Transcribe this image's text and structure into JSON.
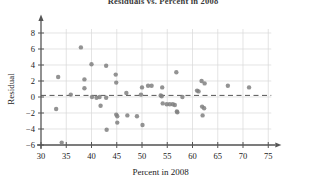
{
  "chart": {
    "title": "Residuals vs. Percent in 2008",
    "title_clipped": true
  },
  "chart_data": {
    "type": "scatter",
    "title": "Residuals vs. Percent in 2008",
    "xlabel": "Percent in 2008",
    "ylabel": "Residual",
    "xlim": [
      30,
      76
    ],
    "ylim": [
      -6,
      9
    ],
    "xticks": [
      30,
      35,
      40,
      45,
      50,
      55,
      60,
      65,
      70,
      75
    ],
    "yticks": [
      -6,
      -4,
      -2,
      0,
      2,
      4,
      6,
      8
    ],
    "grid": true,
    "legend": "none",
    "marker_color": "#808080",
    "grid_color": "#d8d8d8",
    "axis_color": "#555555",
    "reference_line": {
      "type": "dashed-horizontal",
      "y": 0.2,
      "color": "#555555"
    },
    "points": [
      {
        "x": 33.0,
        "y": -1.5
      },
      {
        "x": 33.4,
        "y": 2.5
      },
      {
        "x": 34.1,
        "y": -5.7
      },
      {
        "x": 35.9,
        "y": 0.3
      },
      {
        "x": 37.9,
        "y": 6.2
      },
      {
        "x": 38.6,
        "y": 2.2
      },
      {
        "x": 38.6,
        "y": 1.1
      },
      {
        "x": 40.0,
        "y": 4.1
      },
      {
        "x": 40.1,
        "y": 0.0
      },
      {
        "x": 41.0,
        "y": -0.1
      },
      {
        "x": 41.6,
        "y": 0.0
      },
      {
        "x": 41.8,
        "y": -1.1
      },
      {
        "x": 42.9,
        "y": 3.9
      },
      {
        "x": 42.9,
        "y": -0.1
      },
      {
        "x": 43.0,
        "y": -4.1
      },
      {
        "x": 44.8,
        "y": 2.8
      },
      {
        "x": 44.9,
        "y": 1.8
      },
      {
        "x": 44.9,
        "y": -2.2
      },
      {
        "x": 45.1,
        "y": -2.4
      },
      {
        "x": 45.1,
        "y": -3.2
      },
      {
        "x": 46.9,
        "y": 0.5
      },
      {
        "x": 47.1,
        "y": -2.3
      },
      {
        "x": 49.0,
        "y": -2.4
      },
      {
        "x": 49.8,
        "y": 0.3
      },
      {
        "x": 50.0,
        "y": 1.2
      },
      {
        "x": 50.1,
        "y": -3.5
      },
      {
        "x": 51.2,
        "y": 1.4
      },
      {
        "x": 51.9,
        "y": 1.4
      },
      {
        "x": 53.7,
        "y": 0.2
      },
      {
        "x": 53.9,
        "y": 0.1
      },
      {
        "x": 54.0,
        "y": 1.2
      },
      {
        "x": 54.1,
        "y": -0.8
      },
      {
        "x": 54.9,
        "y": -0.9
      },
      {
        "x": 55.5,
        "y": -0.9
      },
      {
        "x": 56.1,
        "y": -0.9
      },
      {
        "x": 56.5,
        "y": -1.0
      },
      {
        "x": 56.8,
        "y": 3.1
      },
      {
        "x": 56.9,
        "y": -1.8
      },
      {
        "x": 57.0,
        "y": -1.9
      },
      {
        "x": 58.0,
        "y": 0.0
      },
      {
        "x": 60.9,
        "y": 0.8
      },
      {
        "x": 61.2,
        "y": 0.7
      },
      {
        "x": 61.8,
        "y": 2.0
      },
      {
        "x": 62.4,
        "y": 1.7
      },
      {
        "x": 61.9,
        "y": -1.2
      },
      {
        "x": 62.3,
        "y": -1.4
      },
      {
        "x": 62.0,
        "y": -2.3
      },
      {
        "x": 67.0,
        "y": 1.4
      },
      {
        "x": 71.2,
        "y": 1.2
      }
    ]
  }
}
